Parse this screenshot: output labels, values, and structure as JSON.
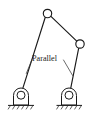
{
  "figure": {
    "background_color": "#ffffff",
    "line_color": "#1a1a1a",
    "leader_color": "#3a3a3a",
    "width": 94,
    "height": 114
  },
  "annotation": {
    "label": "Parallel",
    "x": 31,
    "y": 58
  },
  "joints": [
    {
      "name": "top-pin-joint",
      "label": "",
      "cx": 47.5,
      "cy": 13.5,
      "r": 4.2
    },
    {
      "name": "right-pin-joint",
      "label": "",
      "cx": 80.0,
      "cy": 44.0,
      "r": 4.2
    }
  ],
  "supports": [
    {
      "name": "left-pin-support",
      "cx": 21.0,
      "cy": 95.0,
      "pin_r": 4.0,
      "ground_y": 105.5,
      "ground_x1": 8.0,
      "ground_x2": 34.0
    },
    {
      "name": "right-pin-support",
      "cx": 69.0,
      "cy": 95.0,
      "pin_r": 4.0,
      "ground_y": 105.5,
      "ground_x1": 57.0,
      "ground_x2": 82.0
    }
  ],
  "members": [
    {
      "name": "member-top-to-right",
      "x1": 50.7,
      "y1": 16.2,
      "x2": 77.0,
      "y2": 41.3
    },
    {
      "name": "member-top-to-left-support",
      "x1": 45.0,
      "y1": 17.5,
      "x2": 22.0,
      "y2": 90.8
    },
    {
      "name": "member-right-to-right-support",
      "x1": 78.6,
      "y1": 48.0,
      "x2": 70.2,
      "y2": 90.8
    }
  ],
  "leaders": [
    {
      "name": "leader-to-left-member",
      "x1": 31.5,
      "y1": 59.5,
      "x2": 26.5,
      "y2": 73.0
    },
    {
      "name": "leader-to-right-member",
      "x1": 64.0,
      "y1": 59.5,
      "x2": 72.5,
      "y2": 75.0
    }
  ]
}
